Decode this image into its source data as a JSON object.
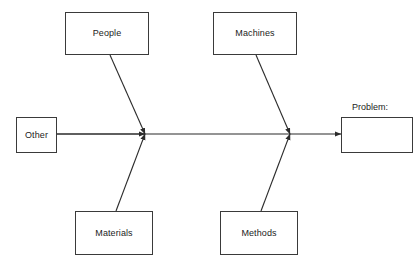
{
  "diagram": {
    "type": "fishbone-ishikawa",
    "background_color": "#ffffff",
    "line_color": "#2b2b2b",
    "text_color": "#1c1c1c",
    "spine": {
      "name": "main-spine-arrow",
      "from_x": 56,
      "to_x": 341,
      "y": 134
    },
    "categories": [
      {
        "id": "people",
        "label": "People",
        "position": "top-left",
        "box": {
          "x": 65,
          "y": 12,
          "w": 84,
          "h": 43
        },
        "bone": {
          "x1": 110,
          "y1": 55,
          "x2": 145,
          "y2": 134
        }
      },
      {
        "id": "machines",
        "label": "Machines",
        "position": "top-right",
        "box": {
          "x": 213,
          "y": 12,
          "w": 84,
          "h": 43
        },
        "bone": {
          "x1": 256,
          "y1": 55,
          "x2": 290,
          "y2": 134
        }
      },
      {
        "id": "other",
        "label": "Other",
        "position": "left-head",
        "box": {
          "x": 16,
          "y": 117,
          "w": 41,
          "h": 36
        },
        "bone": {
          "x1": 57,
          "y1": 134,
          "x2": 145,
          "y2": 134
        }
      },
      {
        "id": "materials",
        "label": "Materials",
        "position": "bottom-left",
        "box": {
          "x": 75,
          "y": 211,
          "w": 78,
          "h": 44
        },
        "bone": {
          "x1": 116,
          "y1": 211,
          "x2": 145,
          "y2": 134
        }
      },
      {
        "id": "methods",
        "label": "Methods",
        "position": "bottom-right",
        "box": {
          "x": 220,
          "y": 211,
          "w": 78,
          "h": 44
        },
        "bone": {
          "x1": 261,
          "y1": 211,
          "x2": 290,
          "y2": 134
        }
      }
    ],
    "effect": {
      "id": "problem",
      "caption": "Problem:",
      "value": "",
      "box": {
        "x": 341,
        "y": 117,
        "w": 72,
        "h": 36
      }
    }
  }
}
